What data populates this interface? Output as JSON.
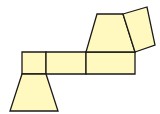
{
  "diagram": {
    "type": "net",
    "fill": "#FFF9C0",
    "stroke": "#1a1a1a",
    "stroke_width": 1.3,
    "shapes": [
      {
        "name": "rect-left-square",
        "points": "22,52 46,52 46,74 22,74"
      },
      {
        "name": "rect-middle",
        "points": "46,52 86,52 86,74 46,74"
      },
      {
        "name": "rect-right",
        "points": "86,52 135,52 135,74 86,74"
      },
      {
        "name": "trapezoid-top",
        "points": "97,14 123,14 135,52 86,52"
      },
      {
        "name": "rotated-square",
        "points": "123,14 147,7 155,45 135,52"
      },
      {
        "name": "trapezoid-bottom",
        "points": "22,74 46,74 58,111 10,111"
      }
    ]
  }
}
